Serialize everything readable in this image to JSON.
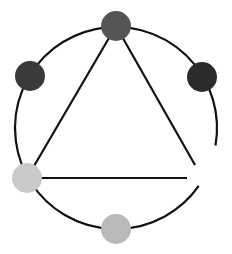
{
  "diagram": {
    "type": "circle-with-inscribed-triangle",
    "circle": {
      "cx": 116,
      "cy": 128,
      "r": 101,
      "stroke": "#111111",
      "stroke_width": 2.2,
      "gap": {
        "start_angle_deg": 10,
        "end_angle_deg": 35
      }
    },
    "triangle_lines": [
      {
        "x1": 116,
        "y1": 26,
        "x2": 27,
        "y2": 178
      },
      {
        "x1": 116,
        "y1": 26,
        "x2": 195,
        "y2": 165
      },
      {
        "x1": 27,
        "y1": 178,
        "x2": 187,
        "y2": 178
      }
    ],
    "nodes": [
      {
        "name": "top",
        "cx": 116,
        "cy": 26,
        "r": 15,
        "color": "#555555"
      },
      {
        "name": "upper-left",
        "cx": 30,
        "cy": 76,
        "r": 15,
        "color": "#3a3a3a"
      },
      {
        "name": "upper-right",
        "cx": 202,
        "cy": 77,
        "r": 15,
        "color": "#2b2b2b"
      },
      {
        "name": "lower-left",
        "cx": 27,
        "cy": 178,
        "r": 15,
        "color": "#c9c9c9"
      },
      {
        "name": "bottom",
        "cx": 116,
        "cy": 229,
        "r": 15,
        "color": "#b9b9b9"
      }
    ]
  }
}
